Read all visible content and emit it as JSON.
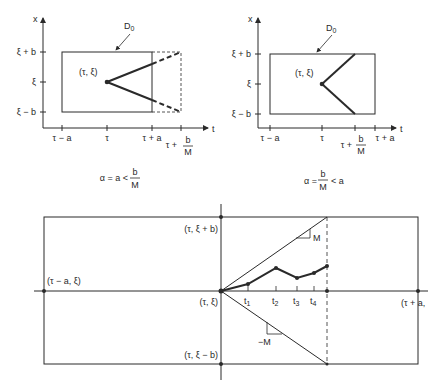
{
  "top_left": {
    "axis_x_label": "x",
    "axis_t_label": "t",
    "domain_label": "D",
    "domain_subscript": "0",
    "y_ticks": [
      "ξ + b",
      "ξ",
      "ξ − b"
    ],
    "x_ticks": [
      "τ − a",
      "τ",
      "τ + a"
    ],
    "x_tick_frac_prefix": "τ +",
    "x_tick_frac_num": "b",
    "x_tick_frac_den": "M",
    "point_label": "(τ, ξ)",
    "caption_prefix": "α = a <",
    "caption_num": "b",
    "caption_den": "M"
  },
  "top_right": {
    "axis_x_label": "x",
    "axis_t_label": "t",
    "domain_label": "D",
    "domain_subscript": "0",
    "y_ticks": [
      "ξ + b",
      "ξ",
      "ξ − b"
    ],
    "x_ticks": [
      "τ − a",
      "τ",
      "τ + a"
    ],
    "x_tick_frac_prefix": "τ +",
    "x_tick_frac_num": "b",
    "x_tick_frac_den": "M",
    "point_label": "(τ, ξ)",
    "caption_prefix": "α =",
    "caption_num": "b",
    "caption_den": "M",
    "caption_suffix": "< a"
  },
  "bottom": {
    "labels": {
      "top": "(τ, ξ + b)",
      "left": "(τ − a, ξ)",
      "center": "(τ, ξ)",
      "bottom": "(τ, ξ − b)",
      "right": "(τ + a,"
    },
    "t_ticks": [
      "t",
      "t",
      "t",
      "t"
    ],
    "t_subscripts": [
      "1",
      "2",
      "3",
      "4"
    ],
    "slope_upper": "M",
    "slope_lower": "−M"
  }
}
